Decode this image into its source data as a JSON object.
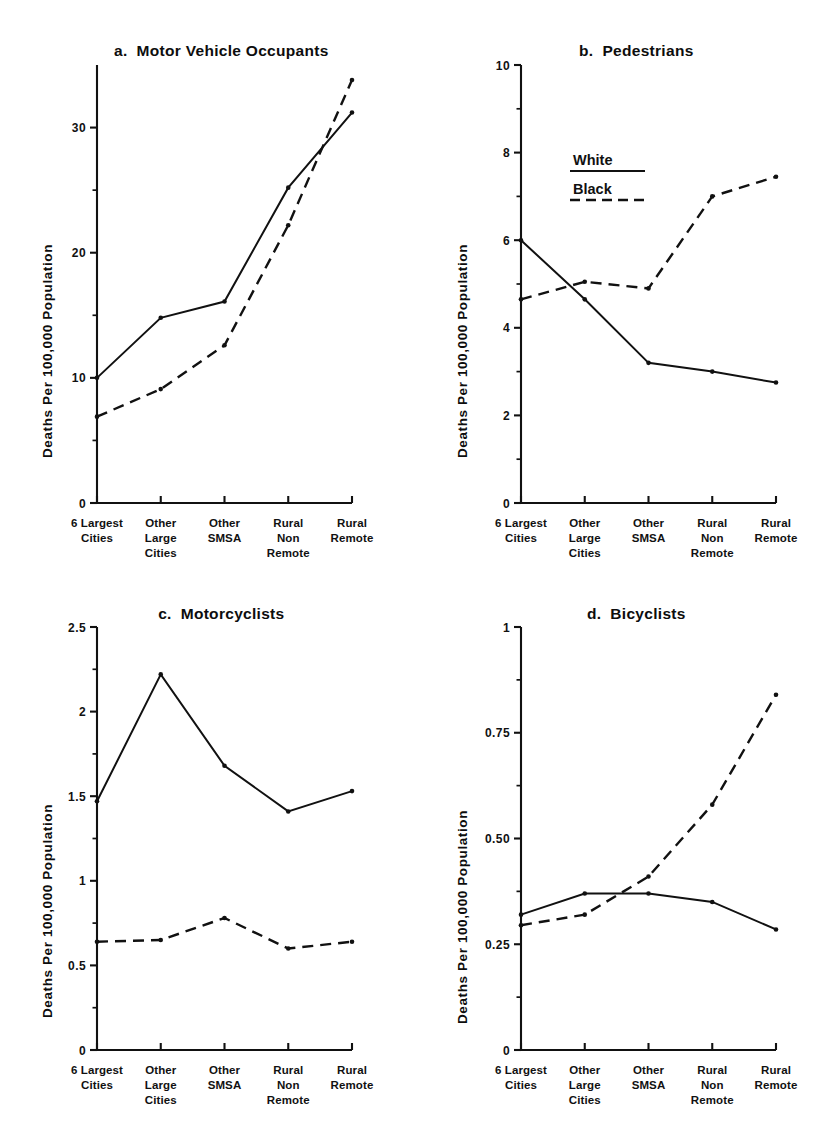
{
  "figure": {
    "y_axis_label": "Deaths Per 100,000 Population",
    "categories": [
      [
        "6 Largest",
        "Cities"
      ],
      [
        "Other",
        "Large",
        "Cities"
      ],
      [
        "Other",
        "SMSA"
      ],
      [
        "Rural",
        "Non",
        "Remote"
      ],
      [
        "Rural",
        "Remote"
      ]
    ],
    "legend": {
      "white_label": "White",
      "black_label": "Black"
    },
    "ink_color": "#111111",
    "background_color": "#ffffff"
  },
  "panels": {
    "a": {
      "letter": "a.",
      "title": "Motor Vehicle Occupants"
    },
    "b": {
      "letter": "b.",
      "title": "Pedestrians"
    },
    "c": {
      "letter": "c.",
      "title": "Motorcyclists"
    },
    "d": {
      "letter": "d.",
      "title": "Bicyclists"
    }
  },
  "chart_data": [
    {
      "panel": "a",
      "type": "line",
      "title": "a.  Motor Vehicle Occupants",
      "xlabel": "",
      "ylabel": "Deaths Per 100,000 Population",
      "categories": [
        "6 Largest Cities",
        "Other Large Cities",
        "Other SMSA",
        "Rural Non Remote",
        "Rural Remote"
      ],
      "ylim": [
        0,
        35
      ],
      "ytick_major": [
        0,
        10,
        20,
        30
      ],
      "ytick_major_labels": [
        "0",
        "10",
        "20",
        "30"
      ],
      "ytick_minor": [
        5,
        15,
        25
      ],
      "grid": false,
      "legend_position": "none",
      "series": [
        {
          "name": "White",
          "style": "solid",
          "values": [
            10.0,
            14.8,
            16.1,
            25.2,
            31.2
          ]
        },
        {
          "name": "Black",
          "style": "dashed",
          "values": [
            6.9,
            9.1,
            12.6,
            22.2,
            33.8
          ]
        }
      ]
    },
    {
      "panel": "b",
      "type": "line",
      "title": "b.  Pedestrians",
      "xlabel": "",
      "ylabel": "Deaths Per 100,000 Population",
      "categories": [
        "6 Largest Cities",
        "Other Large Cities",
        "Other SMSA",
        "Rural Non Remote",
        "Rural Remote"
      ],
      "ylim": [
        0,
        10
      ],
      "ytick_major": [
        0,
        2,
        4,
        6,
        8,
        10
      ],
      "ytick_major_labels": [
        "0",
        "2",
        "4",
        "6",
        "8",
        "10"
      ],
      "ytick_minor": [
        1,
        3,
        5,
        7,
        9
      ],
      "grid": false,
      "legend_position": "upper-center",
      "series": [
        {
          "name": "White",
          "style": "solid",
          "values": [
            6.0,
            4.65,
            3.2,
            3.0,
            2.75
          ]
        },
        {
          "name": "Black",
          "style": "dashed",
          "values": [
            4.65,
            5.05,
            4.9,
            7.0,
            7.45
          ]
        }
      ]
    },
    {
      "panel": "c",
      "type": "line",
      "title": "c.  Motorcyclists",
      "xlabel": "",
      "ylabel": "Deaths Per 100,000 Population",
      "categories": [
        "6 Largest Cities",
        "Other Large Cities",
        "Other SMSA",
        "Rural Non Remote",
        "Rural Remote"
      ],
      "ylim": [
        0,
        2.5
      ],
      "ytick_major": [
        0,
        0.5,
        1,
        1.5,
        2,
        2.5
      ],
      "ytick_major_labels": [
        "0",
        "0.5",
        "1",
        "1.5",
        "2",
        "2.5"
      ],
      "ytick_minor": [
        0.25,
        0.75,
        1.25,
        1.75,
        2.25
      ],
      "grid": false,
      "legend_position": "none",
      "series": [
        {
          "name": "White",
          "style": "solid",
          "values": [
            1.47,
            2.22,
            1.68,
            1.41,
            1.53
          ]
        },
        {
          "name": "Black",
          "style": "dashed",
          "values": [
            0.64,
            0.65,
            0.78,
            0.6,
            0.64
          ]
        }
      ]
    },
    {
      "panel": "d",
      "type": "line",
      "title": "d.  Bicyclists",
      "xlabel": "",
      "ylabel": "Deaths Per 100,000 Population",
      "categories": [
        "6 Largest Cities",
        "Other Large Cities",
        "Other SMSA",
        "Rural Non Remote",
        "Rural Remote"
      ],
      "ylim": [
        0,
        1
      ],
      "ytick_major": [
        0,
        0.25,
        0.5,
        0.75,
        1
      ],
      "ytick_major_labels": [
        "0",
        "0.25",
        "0.50",
        "0.75",
        "1"
      ],
      "ytick_minor": [
        0.125,
        0.375,
        0.625,
        0.875
      ],
      "grid": false,
      "legend_position": "none",
      "series": [
        {
          "name": "White",
          "style": "solid",
          "values": [
            0.32,
            0.37,
            0.37,
            0.35,
            0.285
          ]
        },
        {
          "name": "Black",
          "style": "dashed",
          "values": [
            0.295,
            0.32,
            0.41,
            0.58,
            0.84
          ]
        }
      ]
    }
  ]
}
